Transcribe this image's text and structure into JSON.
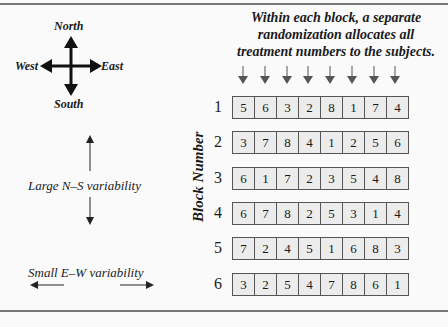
{
  "compass": {
    "north": "North",
    "south": "South",
    "east": "East",
    "west": "West"
  },
  "labels": {
    "ns_variability": "Large N–S variability",
    "ew_variability": "Small E–W variability",
    "block_axis": "Block Number"
  },
  "title": {
    "line1": "Within each block, a separate",
    "line2": "randomization allocates all",
    "line3": "treatment numbers to the subjects."
  },
  "blocks": [
    {
      "label": "1",
      "values": [
        "5",
        "6",
        "3",
        "2",
        "8",
        "1",
        "7",
        "4"
      ]
    },
    {
      "label": "2",
      "values": [
        "3",
        "7",
        "8",
        "4",
        "1",
        "2",
        "5",
        "6"
      ]
    },
    {
      "label": "3",
      "values": [
        "6",
        "1",
        "7",
        "2",
        "3",
        "5",
        "4",
        "8"
      ]
    },
    {
      "label": "4",
      "values": [
        "6",
        "7",
        "8",
        "2",
        "5",
        "3",
        "1",
        "4"
      ]
    },
    {
      "label": "5",
      "values": [
        "7",
        "2",
        "4",
        "5",
        "1",
        "6",
        "8",
        "3"
      ]
    },
    {
      "label": "6",
      "values": [
        "3",
        "2",
        "5",
        "4",
        "7",
        "8",
        "6",
        "1"
      ]
    }
  ],
  "colors": {
    "cell_bg": "#ececec",
    "border": "#555555",
    "arrow": "#555555"
  }
}
